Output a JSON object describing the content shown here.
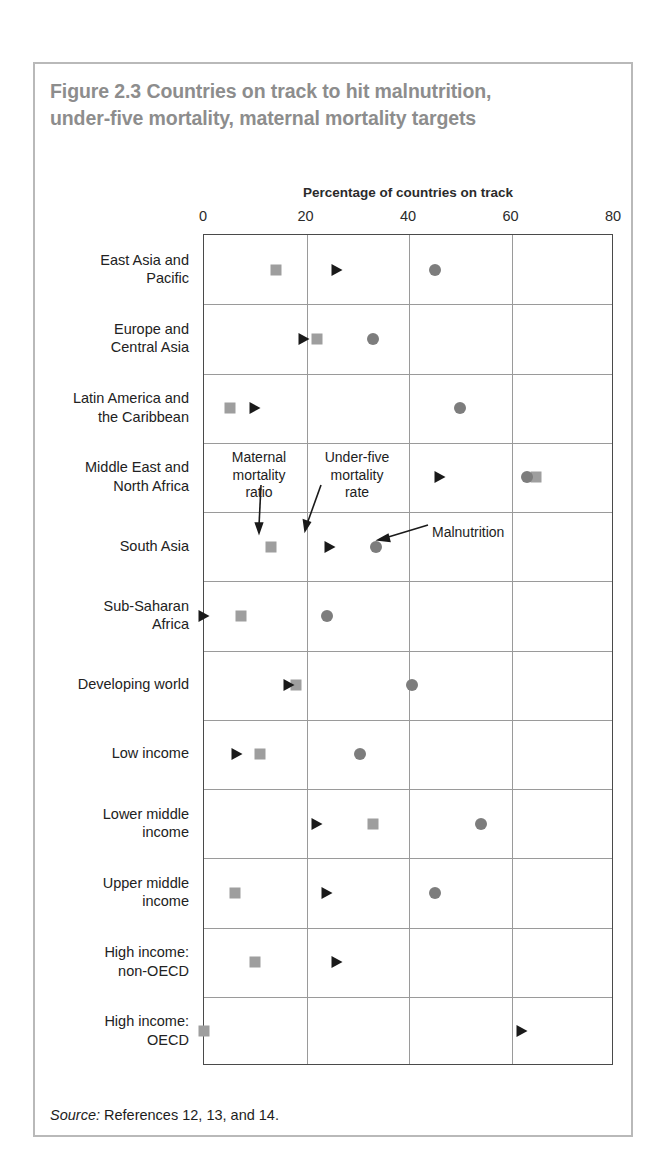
{
  "figure": {
    "title_line1": "Figure 2.3  Countries on track to hit malnutrition,",
    "title_line2": "under-five mortality, maternal mortality targets",
    "source_label": "Source:",
    "source_text": " References 12, 13, and 14."
  },
  "annotations": {
    "maternal": "Maternal\nmortality\nratio",
    "underfive": "Under-five\nmortality\nrate",
    "malnutrition": "Malnutrition"
  },
  "chart_data": {
    "type": "scatter",
    "title": "Figure 2.3  Countries on track to hit malnutrition, under-five mortality, maternal mortality targets",
    "xlabel": "Percentage of countries on track",
    "ylabel": "",
    "xlim": [
      0,
      80
    ],
    "xticks": [
      0,
      20,
      40,
      60,
      80
    ],
    "xtick_labels": [
      "0",
      "20",
      "40",
      "60",
      "80"
    ],
    "grid": "vertical-and-row-separators",
    "legend": "annotated-inline",
    "orientation": "horizontal",
    "categories": [
      "East Asia and\nPacific",
      "Europe and\nCentral Asia",
      "Latin America and\nthe Caribbean",
      "Middle East and\nNorth Africa",
      "South Asia",
      "Sub-Saharan\nAfrica",
      "Developing world",
      "Low income",
      "Lower middle\nincome",
      "Upper middle\nincome",
      "High income:\nnon-OECD",
      "High income:\nOECD"
    ],
    "series": [
      {
        "name": "Maternal mortality ratio",
        "marker": "square",
        "color": "#9e9e9e",
        "values": [
          14,
          22,
          5,
          64.7,
          13,
          7.2,
          18,
          11,
          33,
          6,
          10,
          0
        ]
      },
      {
        "name": "Under-five mortality rate",
        "marker": "triangle",
        "color": "#1a1a1a",
        "values": [
          26,
          19.5,
          10,
          46,
          24.5,
          0,
          16.5,
          6.5,
          22,
          24,
          26,
          62
        ]
      },
      {
        "name": "Malnutrition",
        "marker": "circle",
        "color": "#7d7d7d",
        "values": [
          45,
          33,
          50,
          63,
          33.5,
          24,
          40.5,
          30.5,
          54,
          45,
          null,
          null
        ]
      }
    ]
  }
}
